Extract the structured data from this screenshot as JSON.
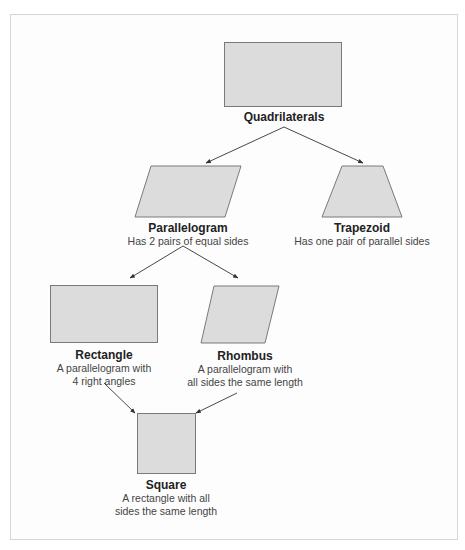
{
  "diagram": {
    "fill_color": "#dcdcdc",
    "stroke_color": "#7a7a7a",
    "nodes": {
      "quadrilaterals": {
        "title": "Quadrilaterals",
        "description": ""
      },
      "parallelogram": {
        "title": "Parallelogram",
        "description": "Has 2 pairs of equal sides"
      },
      "trapezoid": {
        "title": "Trapezoid",
        "description": "Has one pair of parallel sides"
      },
      "rectangle": {
        "title": "Rectangle",
        "description_line1": "A parallelogram with",
        "description_line2": "4 right angles"
      },
      "rhombus": {
        "title": "Rhombus",
        "description_line1": "A parallelogram with",
        "description_line2": "all sides the same length"
      },
      "square": {
        "title": "Square",
        "description_line1": "A rectangle with all",
        "description_line2": "sides the same length"
      }
    },
    "edges": [
      {
        "from": "Quadrilaterals",
        "to": "Parallelogram"
      },
      {
        "from": "Quadrilaterals",
        "to": "Trapezoid"
      },
      {
        "from": "Parallelogram",
        "to": "Rectangle"
      },
      {
        "from": "Parallelogram",
        "to": "Rhombus"
      },
      {
        "from": "Rectangle",
        "to": "Square"
      },
      {
        "from": "Rhombus",
        "to": "Square"
      }
    ]
  }
}
